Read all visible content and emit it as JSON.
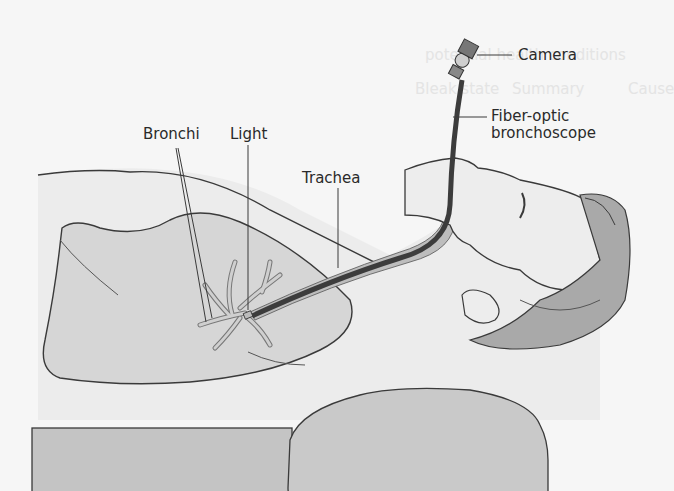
{
  "figure": {
    "labels": {
      "camera": "Camera",
      "fiber_optic_line1": "Fiber-optic",
      "fiber_optic_line2": "bronchoscope",
      "bronchi": "Bronchi",
      "light": "Light",
      "trachea": "Trachea"
    },
    "bleed_through_text": {
      "line1": "potential health conditions",
      "col1": "Bleak state",
      "col2": "Summary",
      "col3": "Cause"
    },
    "colors": {
      "background": "#f6f6f6",
      "outline": "#3a3a3a",
      "lung_fill": "#d6d6d6",
      "body_fill": "#ececec",
      "hair_fill": "#a9a9a9",
      "mattress_fill": "#c4c4c4",
      "pillow_fill": "#c9c9c9",
      "scope_dark": "#3c3c3c",
      "airway_fill": "#bdbdbd"
    }
  }
}
